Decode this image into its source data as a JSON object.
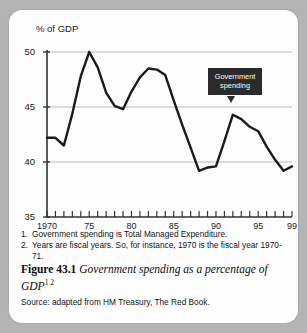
{
  "chart_data": {
    "type": "line",
    "title": "",
    "ylabel": "% of GDP",
    "xlabel": "",
    "ylim": [
      35,
      50
    ],
    "xlim": [
      1970,
      1999
    ],
    "grid": true,
    "gridlines_y": [
      40,
      45,
      50
    ],
    "ytick_labels": [
      "50",
      "45",
      "40",
      "35"
    ],
    "ytick_values": [
      50,
      45,
      40,
      35
    ],
    "xtick_labels": [
      "1970",
      "75",
      "80",
      "85",
      "90",
      "95",
      "99"
    ],
    "xtick_values": [
      1970,
      1975,
      1980,
      1985,
      1990,
      1995,
      1999
    ],
    "minor_xticks_every": 1,
    "legend_position": "none",
    "series": [
      {
        "name": "Government spending",
        "x": [
          1970,
          1971,
          1972,
          1973,
          1974,
          1975,
          1976,
          1977,
          1978,
          1979,
          1980,
          1981,
          1982,
          1983,
          1984,
          1985,
          1986,
          1987,
          1988,
          1989,
          1990,
          1991,
          1992,
          1993,
          1994,
          1995,
          1996,
          1997,
          1998,
          1999
        ],
        "values": [
          42.2,
          42.2,
          41.5,
          44.4,
          47.8,
          50.0,
          48.6,
          46.3,
          45.1,
          44.8,
          46.4,
          47.7,
          48.5,
          48.4,
          47.9,
          45.6,
          43.4,
          41.3,
          39.2,
          39.5,
          39.6,
          41.9,
          44.3,
          43.9,
          43.2,
          42.8,
          41.4,
          40.2,
          39.2,
          39.6
        ]
      }
    ],
    "annotations": [
      {
        "text": "Government spending",
        "text_lines": [
          "Government",
          "spending"
        ],
        "points_to_x": 1992,
        "points_to_y": 44.3,
        "style": "dark-box-with-pointer"
      }
    ]
  },
  "notes": [
    {
      "number": "1.",
      "text": "Government spending is Total Managed Expenditure."
    },
    {
      "number": "2.",
      "text": "Years are fiscal years.  So, for instance, 1970 is the fiscal year 1970-71."
    }
  ],
  "caption": {
    "figure_number": "Figure 43.1",
    "text": "Government spending as a percentage of GDP",
    "superscripts": "1 2"
  },
  "source": "Source: adapted from HM Treasury, The Red Book.",
  "colors": {
    "page_background": "#b4b4b4",
    "card_background": "#fdfdfd",
    "line": "#1a1a1a",
    "gridline": "#b9b9b9",
    "axis": "#333333",
    "callout_background": "#2b2b2b",
    "callout_text": "#ffffff",
    "text": "#141414"
  }
}
